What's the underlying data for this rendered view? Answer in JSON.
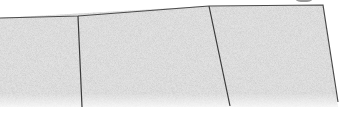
{
  "image": {
    "subject": "sketch of paving slabs",
    "colors": {
      "background": "#ffffff",
      "texture_base": "#d9d9d9",
      "texture_dark": "#a8a8a8",
      "texture_light": "#f0f0f0",
      "outline": "#4a4a4a"
    },
    "slabs": [
      {
        "name": "slab-left",
        "points": "0,18 78,16 82,107 0,107"
      },
      {
        "name": "slab-middle",
        "points": "78,16 209,6 229,107 82,107"
      },
      {
        "name": "slab-right",
        "points": "209,6 323,5 338,107 229,107"
      }
    ]
  }
}
